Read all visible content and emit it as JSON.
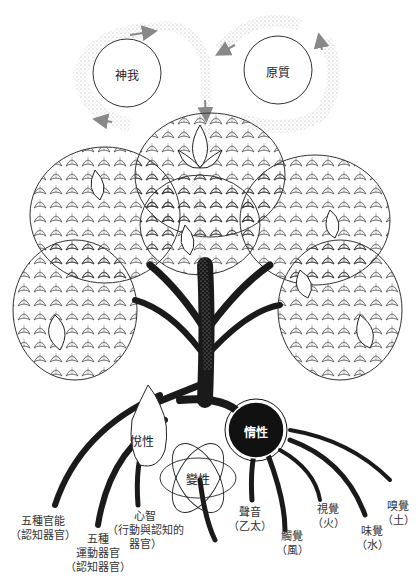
{
  "diagram": {
    "type": "tree-of-creation",
    "top_circles": {
      "purusha": {
        "label": "神我"
      },
      "prakriti": {
        "label": "原質"
      }
    },
    "gunas": {
      "sattva": {
        "label": "悅性"
      },
      "rajas": {
        "label": "變性"
      },
      "tamas": {
        "label": "惰性"
      }
    },
    "roots": {
      "jnana_indriyas": {
        "line1": "五種官能",
        "line2": "（認知器官）"
      },
      "karma_indriyas": {
        "line1": "五種",
        "line2": "運動器官",
        "line3": "（認知器官）"
      },
      "manas": {
        "line1": "心智",
        "line2": "（行動與認知的",
        "line3": "器官）"
      },
      "sound": {
        "line1": "聲音",
        "line2": "（乙太）"
      },
      "touch": {
        "line1": "觸覺",
        "line2": "（風）"
      },
      "sight": {
        "line1": "視覺",
        "line2": "（火）"
      },
      "taste": {
        "line1": "味覺",
        "line2": "（水）"
      },
      "smell": {
        "line1": "嗅覺",
        "line2": "（土）"
      }
    },
    "colors": {
      "ink": "#1a1a1a",
      "stipple": "#9a9a9a",
      "paper": "#ffffff"
    }
  }
}
